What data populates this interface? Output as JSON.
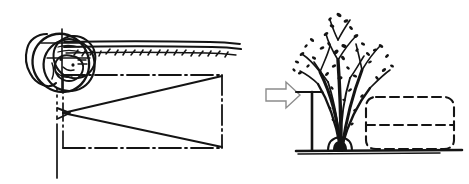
{
  "figure": {
    "background_color": "#ffffff",
    "ink_color": "#141414",
    "arrow_stroke_color": "#8c8c8c",
    "width": 469,
    "height": 184,
    "medium": "hand-drawn ink line sketch",
    "title": "",
    "caption": "",
    "has_text": false
  },
  "left_panel": {
    "name": "plan-view-cone-of-vision",
    "description": "Plan view of a human head with a cone of vision projected toward a wall",
    "head": {
      "name": "head-in-plan",
      "description": "Overlapping freehand circles forming a head seen from above and in front",
      "center_x": 62,
      "center_y": 66,
      "radius": 30
    },
    "wall_band": {
      "name": "wall-band-in-plan",
      "description": "Horizontal hand-drawn wall band with hatching marks",
      "x_start": 62,
      "x_end": 240,
      "y": 44,
      "thickness": 9
    },
    "vision_cone": {
      "name": "cone-of-vision",
      "description": "Two sight lines diverging from the eye point toward the far rectangle edge",
      "apex_x": 63,
      "apex_y": 113,
      "upper_target_x": 222,
      "upper_target_y": 75,
      "lower_target_x": 222,
      "lower_target_y": 148
    },
    "plan_rectangle": {
      "name": "plan-boundary-rectangle",
      "description": "Dash-dot chain line rectangle enclosing the field of view in plan",
      "x": 63,
      "y": 75,
      "width": 159,
      "height": 73,
      "line_style": "dash-dot"
    },
    "centerline": {
      "name": "vertical-centerline",
      "description": "Dash-dot vertical centerline descending from the head through the plan",
      "x": 57,
      "y_start": 88,
      "y_end": 178,
      "line_style": "dash-dot"
    }
  },
  "transition_arrow": {
    "name": "transition-arrow-icon",
    "symbol": "right-block-arrow",
    "description": "Outlined block arrow pointing right, linking plan to elevation",
    "x": 266,
    "y": 82,
    "width": 34,
    "height": 26,
    "direction": "right"
  },
  "right_panel": {
    "name": "elevation-view-planting",
    "description": "Elevation of a multi-stem shrub beside a dashed massing volume on a ground line",
    "plant": {
      "name": "multi-stem-shrub",
      "description": "Multi-stemmed plant with sparse scratchy twig foliage rising from a narrow base",
      "base_x": 341,
      "base_y": 148,
      "canopy_top_y": 12,
      "canopy_left_x": 296,
      "canopy_right_x": 396,
      "stem_count": 5
    },
    "post": {
      "name": "vertical-post",
      "description": "Vertical post or wall edge with a short horizontal cap at the top left of the plant",
      "x": 312,
      "y_top": 92,
      "y_bottom": 150,
      "cap_x_start": 296,
      "cap_x_end": 322,
      "cap_y": 92
    },
    "massing_volume": {
      "name": "dashed-massing-volume",
      "description": "Dashed rounded rectangle representing a building or vehicle mass",
      "x": 366,
      "y": 97,
      "width": 88,
      "height": 52,
      "line_style": "dashed",
      "corner_radius": 10,
      "divider_line_y": 125
    },
    "ground_line": {
      "name": "ground-line",
      "description": "Solid horizontal ground line beneath the plant and massing volume",
      "x_start": 296,
      "x_end": 462,
      "y": 151
    }
  }
}
